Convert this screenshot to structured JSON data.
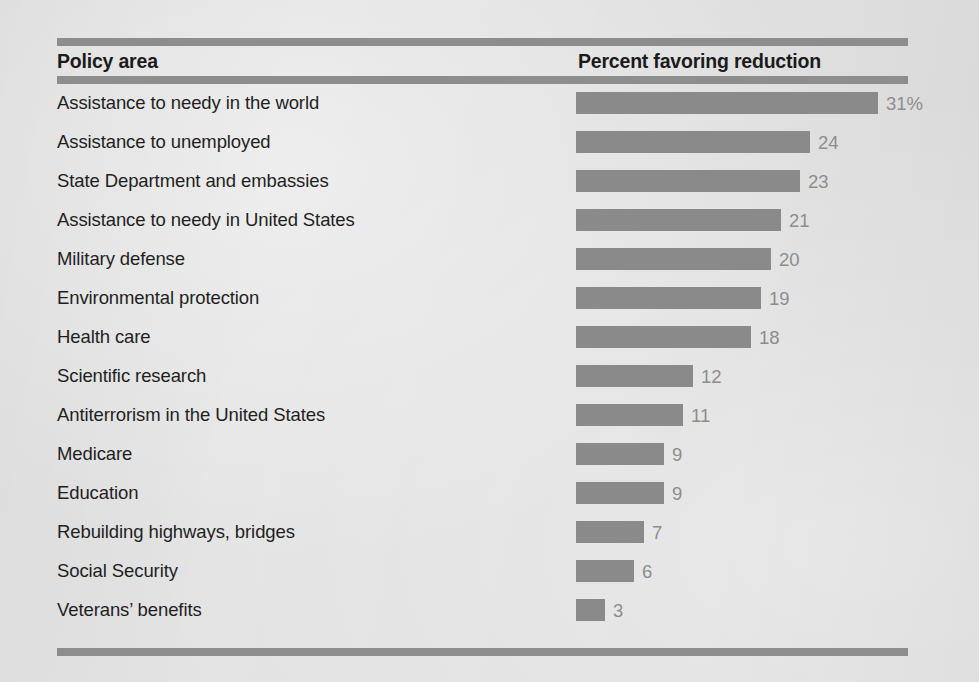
{
  "figure": {
    "columns": {
      "policy_area": "Policy area",
      "percent": "Percent favoring reduction"
    }
  },
  "chart_data": {
    "type": "bar",
    "orientation": "horizontal",
    "title": "",
    "subtitle": "",
    "xlabel": "Percent favoring reduction",
    "ylabel": "Policy area",
    "xlim": [
      0,
      31
    ],
    "grid": false,
    "legend": false,
    "value_suffix_first_row": "%",
    "bar_color": "#8a8a8a",
    "value_label_color": "#8d8d8d",
    "label_color": "#1f1f1f",
    "background_color": "#e3e3e3",
    "rule_color": "#8d8d8d",
    "categories": [
      "Assistance to needy in the world",
      "Assistance to unemployed",
      "State Department and embassies",
      "Assistance to needy in United States",
      "Military defense",
      "Environmental protection",
      "Health care",
      "Scientific research",
      "Antiterrorism in the United States",
      "Medicare",
      "Education",
      "Rebuilding highways, bridges",
      "Social Security",
      "Veterans’ benefits"
    ],
    "values": [
      31,
      24,
      23,
      21,
      20,
      19,
      18,
      12,
      11,
      9,
      9,
      7,
      6,
      3
    ],
    "value_labels": [
      "31%",
      "24",
      "23",
      "21",
      "20",
      "19",
      "18",
      "12",
      "11",
      "9",
      "9",
      "7",
      "6",
      "3"
    ]
  }
}
